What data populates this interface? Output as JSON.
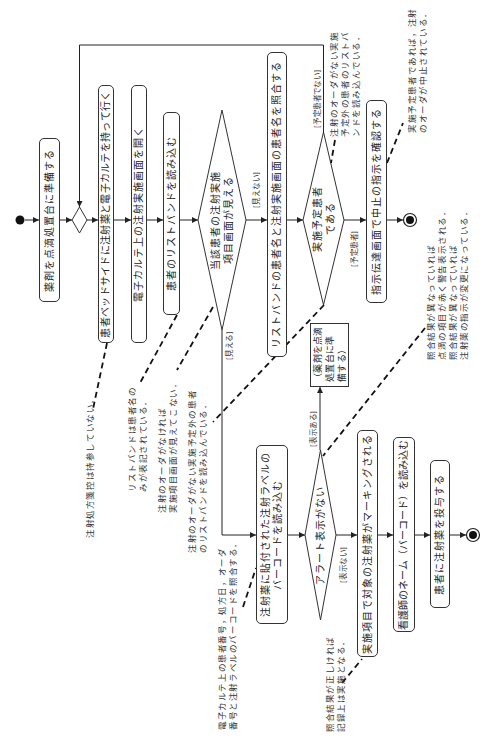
{
  "diagram": {
    "type": "uml-activity-diagram",
    "orientation": "rotated 90 degrees counter-clockwise",
    "actions": {
      "prepare_drug": "薬剤を点滴処置台に準備する",
      "go_bedside": "患者ベッドサイドに注射薬と電子カルテを持って行く",
      "open_injection_screen": "電子カルテ上の注射実施画面を開く",
      "scan_wristband": "患者のリストバンドを読み込む",
      "compare_patient_names": "リストバンドの患者名と注射実施画面の患者名を照合する",
      "confirm_cancel_instruction": "指示伝達画面で中止の指示を確認する",
      "scan_injection_label": [
        "注射薬に貼付された注射ラベルの",
        "バーコードを読み込む"
      ],
      "marking": "実施項目で対象の注射薬がマーキングされる",
      "scan_nurse_name": "看護師のネーム（バーコード）を読み込む",
      "administer": "患者に注射薬を投与する",
      "return_to_prepare": [
        "（薬剤を点滴",
        "処置台に準",
        "備する）"
      ]
    },
    "decisions": {
      "item_screen_visible": [
        "当該患者の注射実施",
        "項目画面が見える"
      ],
      "scheduled_patient": [
        "実施予定患者",
        "である"
      ],
      "no_alert": [
        "アラート表示がない"
      ]
    },
    "guards": {
      "visible": "[見える]",
      "not_visible": "[見えない]",
      "scheduled": "[予定患者]",
      "not_scheduled": "[予定患者でない]",
      "alert_shown": "[表示ある]",
      "alert_not_shown": "[表示ない]"
    },
    "notes": {
      "no_prescription_copy": [
        "注射処方箋控は持参していない．"
      ],
      "wristband_name_only": [
        "リストバンドは患者名の",
        "みが表記されている．"
      ],
      "no_order_no_screen": [
        "注射のオーダがなければ",
        "実施項目画面が見えてこない．"
      ],
      "unscheduled_wristband_lower": [
        "注射のオーダがない実施予定外の患者",
        "のリストバンドを読み込んでいる．"
      ],
      "barcode_check": [
        "電子カルテ上の患者番号，処方日，オーダ",
        "番号と注射ラベルのバーコードを照合する．"
      ],
      "record_done": [
        "照合結果が正しければ",
        "記録上は実施となる．"
      ],
      "unscheduled_wristband_upper": [
        "注射のオーダがない実施",
        "予定外の患者のリストバ",
        "ンドを読み込んでいる．"
      ],
      "order_cancelled": [
        "実施予定患者であれば，注射",
        "のオーダが中止されている．"
      ],
      "mismatch_alert": [
        "照合結果が異なっていれば",
        "点滴の項目が赤く警告表示される．",
        "照合結果が異なっていれば",
        "注射薬の指示が変更になっている．"
      ]
    },
    "flows": [
      {
        "from": "initial",
        "to": "prepare_drug"
      },
      {
        "from": "prepare_drug",
        "to": "merge"
      },
      {
        "from": "merge",
        "to": "go_bedside"
      },
      {
        "from": "go_bedside",
        "to": "open_injection_screen"
      },
      {
        "from": "open_injection_screen",
        "to": "scan_wristband"
      },
      {
        "from": "scan_wristband",
        "to": "item_screen_visible"
      },
      {
        "from": "item_screen_visible",
        "to": "compare_patient_names",
        "guard": "[見えない]"
      },
      {
        "from": "item_screen_visible",
        "to": "scan_injection_label",
        "guard": "[見える]"
      },
      {
        "from": "compare_patient_names",
        "to": "scheduled_patient"
      },
      {
        "from": "scheduled_patient",
        "to": "confirm_cancel_instruction",
        "guard": "[予定患者]"
      },
      {
        "from": "scheduled_patient",
        "to": "merge",
        "guard": "[予定患者でない]"
      },
      {
        "from": "confirm_cancel_instruction",
        "to": "final_1"
      },
      {
        "from": "scan_injection_label",
        "to": "no_alert"
      },
      {
        "from": "no_alert",
        "to": "return_to_prepare",
        "guard": "[表示ある]"
      },
      {
        "from": "no_alert",
        "to": "marking",
        "guard": "[表示ない]"
      },
      {
        "from": "marking",
        "to": "scan_nurse_name"
      },
      {
        "from": "scan_nurse_name",
        "to": "administer"
      },
      {
        "from": "administer",
        "to": "final_2"
      }
    ],
    "colors": {
      "line": "#222222",
      "text": "#222222",
      "background": "#ffffff"
    }
  }
}
